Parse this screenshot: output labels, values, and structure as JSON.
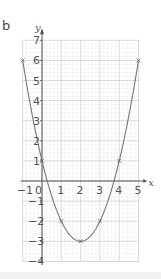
{
  "part_label": "b",
  "chart_data": {
    "type": "line",
    "title": "",
    "xlabel": "x",
    "ylabel": "y",
    "xlim": [
      -1,
      5
    ],
    "ylim": [
      -4,
      7
    ],
    "x_ticks": [
      "-1",
      "0",
      "1",
      "2",
      "3",
      "4",
      "5"
    ],
    "y_ticks": [
      "7",
      "6",
      "5",
      "4",
      "3",
      "2",
      "1",
      "-1",
      "-2",
      "-3",
      "-4"
    ],
    "grid": true,
    "series": [
      {
        "name": "y = x^2 - 4x + 1",
        "x": [
          -1,
          0,
          1,
          2,
          3,
          4,
          5
        ],
        "values": [
          6,
          1,
          -2,
          -3,
          -2,
          1,
          6
        ],
        "marker": "x",
        "color": "#777777"
      }
    ]
  }
}
